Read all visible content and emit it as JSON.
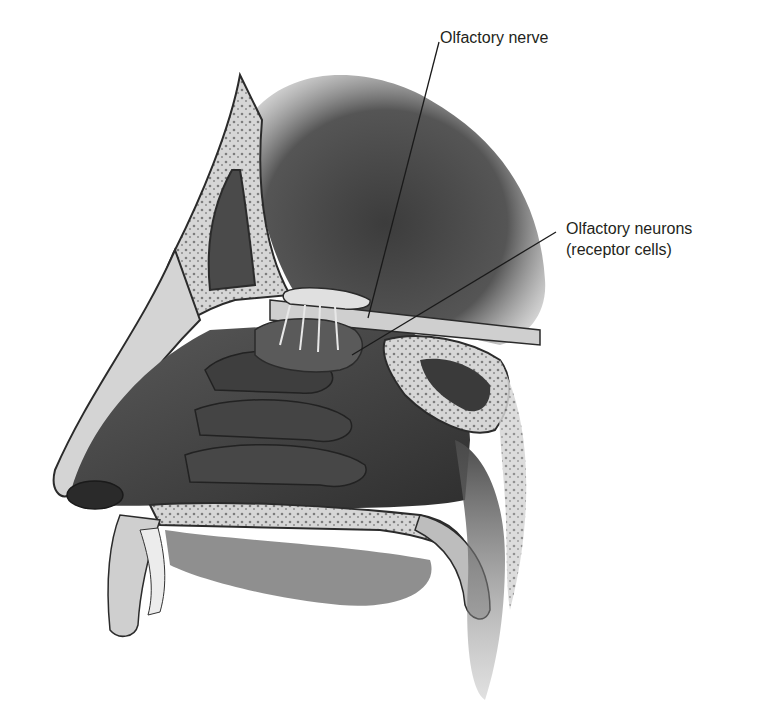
{
  "diagram": {
    "style": "grayscale anatomical illustration",
    "labels": [
      {
        "id": "olfactory-nerve",
        "text": "Olfactory nerve",
        "leader": {
          "from": [
            439,
            42
          ],
          "to": [
            368,
            318
          ]
        }
      },
      {
        "id": "olfactory-neurons",
        "line1": "Olfactory neurons",
        "line2": "(receptor cells)",
        "leader": {
          "from": [
            556,
            232
          ],
          "to": [
            352,
            355
          ]
        }
      }
    ],
    "colors": {
      "background": "#ffffff",
      "label_text": "#231f20",
      "leader_line": "#1a1a1a",
      "tissue_dark": "#3a3a3a",
      "tissue_mid": "#6b6b6b",
      "bone_light": "#d9d9d9",
      "bone_outline": "#2b2b2b"
    }
  }
}
